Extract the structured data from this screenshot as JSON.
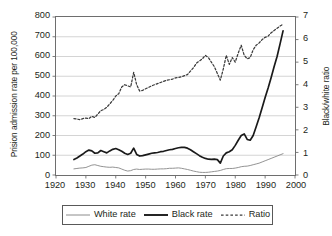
{
  "chart_data": {
    "type": "line",
    "title": "",
    "xlabel": "",
    "ylabel": "Prision admission rate per 100,000",
    "ylabel_right": "Black/white ratio",
    "xlim": [
      1920,
      2000
    ],
    "ylim": [
      0,
      800
    ],
    "ylim_right": [
      0,
      7
    ],
    "grid": true,
    "grid_axis": "y",
    "legend_position": "bottom-center",
    "xticks": [
      1920,
      1930,
      1940,
      1950,
      1960,
      1970,
      1980,
      1990,
      2000
    ],
    "yticks_left": [
      0,
      100,
      200,
      300,
      400,
      500,
      600,
      700,
      800
    ],
    "yticks_right": [
      0,
      1,
      2,
      3,
      4,
      5,
      6,
      7
    ],
    "x": [
      1926,
      1927,
      1928,
      1929,
      1930,
      1931,
      1932,
      1933,
      1934,
      1935,
      1936,
      1937,
      1938,
      1939,
      1940,
      1941,
      1942,
      1943,
      1944,
      1945,
      1946,
      1947,
      1948,
      1949,
      1950,
      1951,
      1952,
      1953,
      1954,
      1955,
      1956,
      1957,
      1958,
      1959,
      1960,
      1961,
      1962,
      1963,
      1964,
      1965,
      1966,
      1967,
      1968,
      1969,
      1970,
      1971,
      1972,
      1973,
      1974,
      1975,
      1976,
      1977,
      1978,
      1979,
      1980,
      1981,
      1982,
      1983,
      1984,
      1985,
      1986,
      1987,
      1988,
      1989,
      1990,
      1991,
      1992,
      1993,
      1994,
      1995,
      1996
    ],
    "series": [
      {
        "name": "White rate",
        "axis": "left",
        "style": "solid-thin",
        "color": "#8c8c8c",
        "values": [
          31,
          33,
          35,
          36,
          38,
          44,
          50,
          52,
          48,
          44,
          42,
          40,
          39,
          40,
          38,
          36,
          30,
          24,
          20,
          22,
          28,
          30,
          28,
          29,
          30,
          30,
          29,
          29,
          30,
          31,
          31,
          32,
          34,
          34,
          35,
          36,
          34,
          31,
          28,
          24,
          20,
          17,
          14,
          13,
          13,
          14,
          16,
          18,
          20,
          23,
          28,
          32,
          33,
          33,
          35,
          38,
          42,
          44,
          45,
          48,
          52,
          56,
          60,
          66,
          72,
          78,
          84,
          90,
          96,
          102,
          108
        ]
      },
      {
        "name": "Black rate",
        "axis": "left",
        "style": "solid-thick",
        "color": "#1a1a1a",
        "values": [
          78,
          86,
          96,
          106,
          118,
          126,
          122,
          110,
          112,
          124,
          118,
          112,
          122,
          130,
          134,
          128,
          120,
          110,
          104,
          110,
          136,
          104,
          96,
          98,
          102,
          106,
          110,
          112,
          114,
          118,
          120,
          124,
          128,
          130,
          134,
          138,
          140,
          140,
          136,
          128,
          118,
          108,
          98,
          90,
          84,
          80,
          79,
          80,
          78,
          60,
          96,
          112,
          118,
          128,
          150,
          176,
          200,
          208,
          180,
          176,
          200,
          244,
          290,
          340,
          392,
          440,
          492,
          548,
          600,
          664,
          730
        ]
      },
      {
        "name": "Ratio",
        "axis": "right",
        "style": "dashed",
        "color": "#3a3a3a",
        "values": [
          2.5,
          2.48,
          2.45,
          2.5,
          2.52,
          2.5,
          2.6,
          2.55,
          2.7,
          2.85,
          2.9,
          3.0,
          3.15,
          3.3,
          3.5,
          3.6,
          3.9,
          4.0,
          3.95,
          3.9,
          4.55,
          4.0,
          3.72,
          3.75,
          3.82,
          3.88,
          3.95,
          4.0,
          4.05,
          4.1,
          4.15,
          4.2,
          4.22,
          4.25,
          4.3,
          4.32,
          4.35,
          4.4,
          4.45,
          4.6,
          4.75,
          4.95,
          5.05,
          5.15,
          5.3,
          5.2,
          5.0,
          4.8,
          4.5,
          4.2,
          4.7,
          5.3,
          4.9,
          5.2,
          5.0,
          5.4,
          5.75,
          5.3,
          5.15,
          5.2,
          5.55,
          5.75,
          5.85,
          6.0,
          6.1,
          6.15,
          6.3,
          6.4,
          6.5,
          6.6,
          6.68
        ]
      }
    ]
  },
  "legend": {
    "entries": [
      {
        "label": "White rate",
        "style": "solid-thin"
      },
      {
        "label": "Black rate",
        "style": "solid-thick"
      },
      {
        "label": "Ratio",
        "style": "dashed"
      }
    ]
  },
  "colors": {
    "white_rate": "#8c8c8c",
    "black_rate": "#1a1a1a",
    "ratio": "#3a3a3a",
    "grid": "#c9c9c9",
    "axis": "#6e6e6e",
    "text": "#231f20",
    "background": "#ffffff"
  }
}
